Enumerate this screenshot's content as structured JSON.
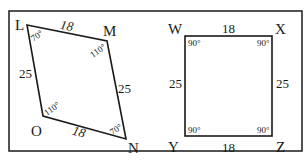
{
  "figure": {
    "frame": {
      "x": 9,
      "y": 11,
      "width": 293,
      "height": 140
    },
    "colors": {
      "line": "#1a1a1a",
      "background": "#ffffff"
    }
  },
  "parallelogram": {
    "name": "LMNO",
    "vertices": [
      {
        "label": "L",
        "x": 27,
        "y": 25,
        "angle": "70°"
      },
      {
        "label": "M",
        "x": 107,
        "y": 41,
        "angle": "110°"
      },
      {
        "label": "N",
        "x": 126,
        "y": 139,
        "angle": "70°"
      },
      {
        "label": "O",
        "x": 43,
        "y": 116,
        "angle": "110°"
      }
    ],
    "sides": {
      "LM": "18",
      "MN": "25",
      "ON": "18",
      "LO": "25"
    }
  },
  "rectangle": {
    "name": "WXZY",
    "vertices": [
      {
        "label": "W",
        "x": 185,
        "y": 36,
        "angle": "90°"
      },
      {
        "label": "X",
        "x": 272,
        "y": 36,
        "angle": "90°"
      },
      {
        "label": "Z",
        "x": 272,
        "y": 136,
        "angle": "90°"
      },
      {
        "label": "Y",
        "x": 185,
        "y": 136,
        "angle": "90°"
      }
    ],
    "sides": {
      "WX": "18",
      "XZ": "25",
      "YZ": "18",
      "WY": "25"
    }
  }
}
